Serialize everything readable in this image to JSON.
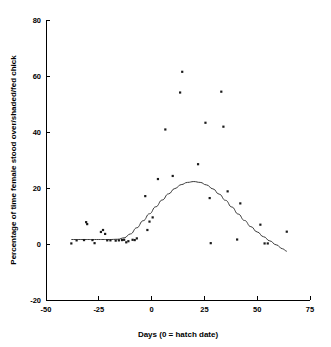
{
  "chart_data": {
    "type": "scatter",
    "title": "",
    "subtitle": "",
    "xlabel": "Days (0 = hatch date)",
    "ylabel": "Percentage of time female stood over/shaded/fed chick",
    "xlim": [
      -50,
      75
    ],
    "ylim": [
      -20,
      80
    ],
    "xticks": [
      -50,
      -25,
      0,
      25,
      50,
      75
    ],
    "xtick_labels": [
      "-50",
      "-25",
      "0",
      "25",
      "50",
      "75"
    ],
    "yticks": [
      -20,
      0,
      20,
      40,
      60,
      80
    ],
    "ytick_labels": [
      "-20",
      "0",
      "20",
      "40",
      "60",
      "80"
    ],
    "grid": false,
    "legend": null,
    "marker": "filled-square",
    "marker_color": "#1a1a1a",
    "curve_color": "#3a3a3a",
    "points": [
      {
        "x": -38.0,
        "y": 0.2
      },
      {
        "x": -35.5,
        "y": 1.3
      },
      {
        "x": -32.0,
        "y": 1.4
      },
      {
        "x": -31.0,
        "y": 7.8
      },
      {
        "x": -30.5,
        "y": 7.1
      },
      {
        "x": -28.0,
        "y": 1.4
      },
      {
        "x": -27.0,
        "y": 0.3
      },
      {
        "x": -24.0,
        "y": 4.3
      },
      {
        "x": -23.0,
        "y": 5.0
      },
      {
        "x": -22.0,
        "y": 3.6
      },
      {
        "x": -21.0,
        "y": 1.3
      },
      {
        "x": -19.5,
        "y": 1.3
      },
      {
        "x": -17.0,
        "y": 1.2
      },
      {
        "x": -15.5,
        "y": 1.3
      },
      {
        "x": -14.0,
        "y": 1.4
      },
      {
        "x": -13.0,
        "y": 1.5
      },
      {
        "x": -12.0,
        "y": 0.6
      },
      {
        "x": -11.0,
        "y": 1.0
      },
      {
        "x": -9.0,
        "y": 1.5
      },
      {
        "x": -8.0,
        "y": 1.4
      },
      {
        "x": -7.0,
        "y": 2.0
      },
      {
        "x": -3.0,
        "y": 17.1
      },
      {
        "x": -2.0,
        "y": 5.0
      },
      {
        "x": -1.0,
        "y": 8.0
      },
      {
        "x": 0.5,
        "y": 9.5
      },
      {
        "x": 3.0,
        "y": 23.2
      },
      {
        "x": 6.5,
        "y": 40.9
      },
      {
        "x": 10.0,
        "y": 24.3
      },
      {
        "x": 13.5,
        "y": 54.1
      },
      {
        "x": 14.5,
        "y": 61.5
      },
      {
        "x": 22.0,
        "y": 28.5
      },
      {
        "x": 25.5,
        "y": 43.3
      },
      {
        "x": 27.5,
        "y": 16.4
      },
      {
        "x": 28.0,
        "y": 0.3
      },
      {
        "x": 33.0,
        "y": 54.4
      },
      {
        "x": 34.0,
        "y": 41.9
      },
      {
        "x": 36.0,
        "y": 18.8
      },
      {
        "x": 40.5,
        "y": 1.6
      },
      {
        "x": 42.0,
        "y": 14.5
      },
      {
        "x": 51.5,
        "y": 6.9
      },
      {
        "x": 53.5,
        "y": 0.2
      },
      {
        "x": 55.0,
        "y": 0.2
      },
      {
        "x": 64.0,
        "y": 4.4
      }
    ],
    "fit_curve": {
      "description": "smoothed bell-shaped trend line",
      "peak_x": 20,
      "peak_y": 22.3,
      "points": [
        {
          "x": -38.0,
          "y": 1.6
        },
        {
          "x": -32.0,
          "y": 1.6
        },
        {
          "x": -26.0,
          "y": 1.6
        },
        {
          "x": -20.0,
          "y": 1.6
        },
        {
          "x": -16.0,
          "y": 1.7
        },
        {
          "x": -13.0,
          "y": 2.2
        },
        {
          "x": -10.0,
          "y": 3.6
        },
        {
          "x": -7.0,
          "y": 5.8
        },
        {
          "x": -4.0,
          "y": 8.3
        },
        {
          "x": -1.0,
          "y": 10.8
        },
        {
          "x": 2.0,
          "y": 13.3
        },
        {
          "x": 5.0,
          "y": 15.7
        },
        {
          "x": 8.0,
          "y": 17.9
        },
        {
          "x": 11.0,
          "y": 19.8
        },
        {
          "x": 14.0,
          "y": 21.2
        },
        {
          "x": 17.0,
          "y": 22.0
        },
        {
          "x": 20.0,
          "y": 22.3
        },
        {
          "x": 23.0,
          "y": 22.0
        },
        {
          "x": 26.0,
          "y": 21.1
        },
        {
          "x": 29.0,
          "y": 19.7
        },
        {
          "x": 32.0,
          "y": 17.8
        },
        {
          "x": 35.0,
          "y": 15.6
        },
        {
          "x": 38.0,
          "y": 13.2
        },
        {
          "x": 41.0,
          "y": 10.7
        },
        {
          "x": 44.0,
          "y": 8.4
        },
        {
          "x": 47.0,
          "y": 6.2
        },
        {
          "x": 50.0,
          "y": 4.3
        },
        {
          "x": 53.0,
          "y": 2.6
        },
        {
          "x": 56.0,
          "y": 1.1
        },
        {
          "x": 59.0,
          "y": -0.3
        },
        {
          "x": 62.0,
          "y": -1.7
        },
        {
          "x": 64.0,
          "y": -2.6
        }
      ]
    }
  }
}
